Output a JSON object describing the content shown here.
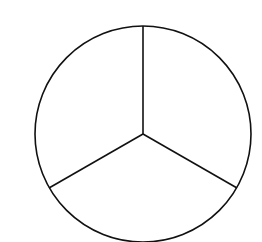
{
  "diagram": {
    "type": "circle-divided-into-three-equal-sectors",
    "sector_count": 3,
    "stroke_color": "#111111",
    "background": "#ffffff",
    "circle": {
      "cx": 143,
      "cy": 134,
      "r": 108
    },
    "radii_endpoints": [
      {
        "x": 143,
        "y": 26
      },
      {
        "x": 49,
        "y": 188
      },
      {
        "x": 237,
        "y": 188
      }
    ]
  }
}
